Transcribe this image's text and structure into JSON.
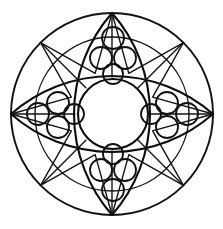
{
  "figure": {
    "background_color": "#ffffff",
    "stroke_color": "#111111",
    "width": 223,
    "height": 229
  },
  "geometry": {
    "center": {
      "cx": 112,
      "cy": 114
    },
    "outer_circle": {
      "cx": 112,
      "cy": 114,
      "r": 101,
      "stroke_width": 1.9
    },
    "inner_ring_circle": {
      "cx": 112,
      "cy": 114,
      "r": 77,
      "stroke_width": 1.4
    },
    "center_circle": {
      "cx": 113,
      "cy": 114,
      "r": 35,
      "stroke_width": 2.1
    },
    "star": {
      "points": 8,
      "outer_radius": 101,
      "inner_radius": 44,
      "rotation_deg": 0,
      "stroke_width": 1.5,
      "vertices": [
        {
          "x": 112,
          "y": 13
        },
        {
          "x": 143,
          "y": 83
        },
        {
          "x": 213,
          "y": 114
        },
        {
          "x": 143,
          "y": 145
        },
        {
          "x": 112,
          "y": 215
        },
        {
          "x": 81,
          "y": 145
        },
        {
          "x": 11,
          "y": 114
        },
        {
          "x": 81,
          "y": 83
        }
      ]
    },
    "vertical_petal": {
      "tip_top": {
        "x": 112,
        "y": 13
      },
      "tip_bottom": {
        "x": 112,
        "y": 215
      },
      "half_width": 38,
      "stroke_width": 2.1
    },
    "horizontal_petal": {
      "tip_left": {
        "x": 11,
        "y": 114
      },
      "tip_right": {
        "x": 213,
        "y": 114
      },
      "half_height": 38,
      "stroke_width": 2.1
    }
  },
  "circle_clusters": [
    {
      "name": "top-cluster",
      "orientation": "vertical",
      "count": 4,
      "circles": [
        {
          "cx": 113,
          "cy": 38,
          "r": 11
        },
        {
          "cx": 101,
          "cy": 58,
          "r": 11
        },
        {
          "cx": 125,
          "cy": 58,
          "r": 11
        },
        {
          "cx": 113,
          "cy": 74,
          "r": 10
        }
      ]
    },
    {
      "name": "bottom-cluster",
      "orientation": "vertical",
      "count": 4,
      "circles": [
        {
          "cx": 113,
          "cy": 190,
          "r": 11
        },
        {
          "cx": 101,
          "cy": 170,
          "r": 11
        },
        {
          "cx": 125,
          "cy": 170,
          "r": 11
        },
        {
          "cx": 113,
          "cy": 154,
          "r": 10
        }
      ]
    },
    {
      "name": "left-cluster",
      "orientation": "horizontal",
      "count": 4,
      "circles": [
        {
          "cx": 38,
          "cy": 114,
          "r": 11
        },
        {
          "cx": 58,
          "cy": 103,
          "r": 11
        },
        {
          "cx": 58,
          "cy": 127,
          "r": 11
        },
        {
          "cx": 74,
          "cy": 114,
          "r": 10
        }
      ]
    },
    {
      "name": "right-cluster",
      "orientation": "horizontal",
      "count": 4,
      "circles": [
        {
          "cx": 187,
          "cy": 114,
          "r": 11
        },
        {
          "cx": 167,
          "cy": 103,
          "r": 11
        },
        {
          "cx": 167,
          "cy": 127,
          "r": 11
        },
        {
          "cx": 151,
          "cy": 114,
          "r": 10
        }
      ]
    }
  ]
}
